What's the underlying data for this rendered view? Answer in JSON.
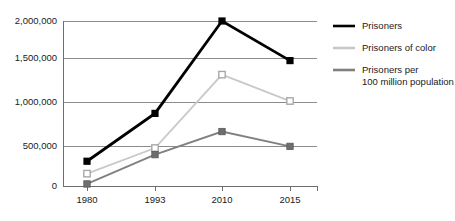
{
  "chart_data": {
    "type": "line",
    "title": "",
    "subtitle": "",
    "xlabel": "",
    "ylabel": "",
    "categories": [
      "1980",
      "1993",
      "2010",
      "2015"
    ],
    "ylim": [
      0,
      2000000
    ],
    "yticks": [
      0,
      500000,
      1000000,
      1500000,
      2000000
    ],
    "ytick_labels": [
      "0",
      "500,000",
      "1,000,000",
      "1,500,000",
      "2,000,000"
    ],
    "grid": true,
    "legend_position": "right",
    "series": [
      {
        "name": "Prisoners",
        "color": "#000000",
        "marker": "square-filled",
        "values": [
          300000,
          880000,
          2000000,
          1520000
        ]
      },
      {
        "name": "Prisoners of color",
        "color": "#c9c9c9",
        "marker": "square-open",
        "values": [
          150000,
          460000,
          1350000,
          1030000
        ]
      },
      {
        "name": "Prisoners per 100 million population",
        "color": "#808080",
        "marker": "square-filled-gray",
        "values": [
          25000,
          380000,
          660000,
          480000
        ]
      }
    ]
  },
  "legend": {
    "entries": [
      {
        "label": "Prisoners",
        "label_line2": "",
        "color": "#000000"
      },
      {
        "label": "Prisoners of color",
        "label_line2": "",
        "color": "#c9c9c9"
      },
      {
        "label": "Prisoners per",
        "label_line2": "100 million population",
        "color": "#808080"
      }
    ]
  },
  "axes": {
    "y_labels": [
      "2,000,000",
      "1,500,000",
      "1,000,000",
      "500,000",
      "0"
    ],
    "x_labels": [
      "1980",
      "1993",
      "2010",
      "2015"
    ]
  }
}
